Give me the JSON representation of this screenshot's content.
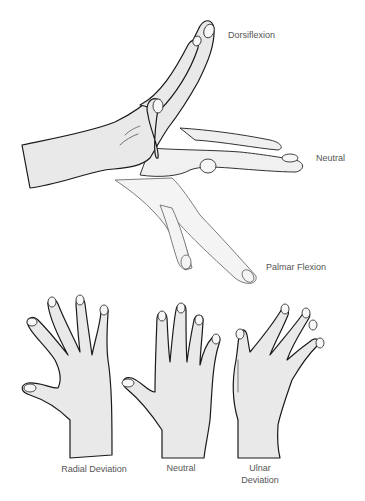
{
  "figure": {
    "top_panel": {
      "title": "Wrist flexion/extension",
      "labels": {
        "dorsiflexion": "Dorsiflexion",
        "neutral": "Neutral",
        "palmar_flexion": "Palmar Flexion"
      }
    },
    "bottom_panel": {
      "title": "Wrist deviation",
      "labels": {
        "radial": "Radial Deviation",
        "neutral": "Neutral",
        "ulnar_line1": "Ulnar",
        "ulnar_line2": "Deviation"
      }
    },
    "colors": {
      "background": "#ffffff",
      "hand_fill": "#e9e9e9",
      "outline": "#1a1a1a",
      "label_text": "#555555"
    }
  }
}
